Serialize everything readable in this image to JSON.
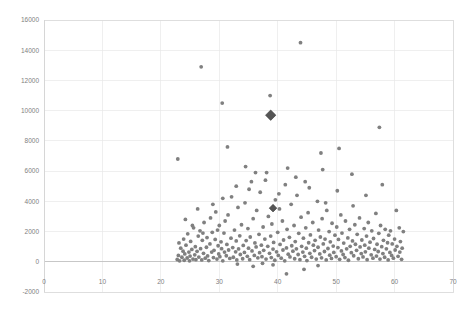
{
  "chart_data": {
    "type": "scatter",
    "title": "",
    "xlabel": "",
    "ylabel": "",
    "xlim": [
      0,
      70
    ],
    "ylim": [
      -2000,
      16000
    ],
    "grid": true,
    "legend": null,
    "xticks": [
      0,
      10,
      20,
      30,
      40,
      50,
      60,
      70
    ],
    "yticks": [
      -2000,
      0,
      2000,
      4000,
      6000,
      8000,
      10000,
      12000,
      14000,
      16000
    ],
    "xtick_labels": [
      "0",
      "10",
      "20",
      "30",
      "40",
      "50",
      "60",
      "70"
    ],
    "ytick_labels": [
      "-2000",
      "0",
      "2000",
      "4000",
      "6000",
      "8000",
      "10000",
      "12000",
      "14000",
      "16000"
    ],
    "marker_color": "#808080",
    "highlight_color": "#555555",
    "series": [
      {
        "name": "observations",
        "marker": "circle",
        "points": [
          [
            22.8,
            150
          ],
          [
            23.0,
            420
          ],
          [
            23.2,
            60
          ],
          [
            23.4,
            900
          ],
          [
            23.1,
            1250
          ],
          [
            23.6,
            300
          ],
          [
            23.8,
            700
          ],
          [
            23.9,
            1500
          ],
          [
            24.0,
            100
          ],
          [
            24.1,
            520
          ],
          [
            24.3,
            1100
          ],
          [
            24.5,
            250
          ],
          [
            24.6,
            1850
          ],
          [
            24.8,
            640
          ],
          [
            24.9,
            60
          ],
          [
            25.0,
            380
          ],
          [
            25.1,
            1350
          ],
          [
            25.3,
            820
          ],
          [
            25.5,
            180
          ],
          [
            25.6,
            2250
          ],
          [
            25.8,
            460
          ],
          [
            25.9,
            1000
          ],
          [
            26.0,
            140
          ],
          [
            26.2,
            690
          ],
          [
            26.4,
            1700
          ],
          [
            26.5,
            310
          ],
          [
            26.7,
            2050
          ],
          [
            26.8,
            870
          ],
          [
            27.0,
            120
          ],
          [
            27.1,
            1420
          ],
          [
            27.3,
            560
          ],
          [
            27.4,
            2600
          ],
          [
            27.6,
            240
          ],
          [
            27.8,
            960
          ],
          [
            27.9,
            1600
          ],
          [
            28.0,
            390
          ],
          [
            28.2,
            80
          ],
          [
            28.4,
            1180
          ],
          [
            28.5,
            2900
          ],
          [
            28.7,
            640
          ],
          [
            28.8,
            1950
          ],
          [
            29.0,
            280
          ],
          [
            29.1,
            760
          ],
          [
            29.3,
            1480
          ],
          [
            29.4,
            3300
          ],
          [
            29.6,
            180
          ],
          [
            29.8,
            1060
          ],
          [
            29.9,
            520
          ],
          [
            30.0,
            2400
          ],
          [
            30.1,
            340
          ],
          [
            30.3,
            1320
          ],
          [
            30.4,
            870
          ],
          [
            30.6,
            60
          ],
          [
            30.8,
            1900
          ],
          [
            30.9,
            640
          ],
          [
            31.0,
            2700
          ],
          [
            31.2,
            400
          ],
          [
            31.3,
            1150
          ],
          [
            31.5,
            3100
          ],
          [
            31.6,
            780
          ],
          [
            31.8,
            220
          ],
          [
            32.0,
            1560
          ],
          [
            32.1,
            4300
          ],
          [
            32.3,
            940
          ],
          [
            32.4,
            300
          ],
          [
            32.6,
            2100
          ],
          [
            32.8,
            660
          ],
          [
            32.9,
            1380
          ],
          [
            33.0,
            120
          ],
          [
            33.2,
            3600
          ],
          [
            33.3,
            850
          ],
          [
            33.5,
            1720
          ],
          [
            33.6,
            480
          ],
          [
            33.8,
            2450
          ],
          [
            34.0,
            200
          ],
          [
            34.1,
            1080
          ],
          [
            34.3,
            620
          ],
          [
            34.4,
            3900
          ],
          [
            34.6,
            1400
          ],
          [
            34.8,
            360
          ],
          [
            34.9,
            2200
          ],
          [
            35.0,
            900
          ],
          [
            35.2,
            140
          ],
          [
            35.3,
            1640
          ],
          [
            35.5,
            5300
          ],
          [
            35.6,
            720
          ],
          [
            35.8,
            2850
          ],
          [
            36.0,
            420
          ],
          [
            36.1,
            1250
          ],
          [
            36.3,
            980
          ],
          [
            36.4,
            3400
          ],
          [
            36.6,
            260
          ],
          [
            36.8,
            1820
          ],
          [
            36.9,
            600
          ],
          [
            37.0,
            4600
          ],
          [
            37.2,
            1100
          ],
          [
            37.3,
            340
          ],
          [
            37.5,
            2300
          ],
          [
            37.6,
            760
          ],
          [
            37.8,
            1500
          ],
          [
            38.0,
            180
          ],
          [
            38.1,
            5900
          ],
          [
            38.3,
            1020
          ],
          [
            38.4,
            3000
          ],
          [
            38.6,
            560
          ],
          [
            38.8,
            1700
          ],
          [
            38.9,
            280
          ],
          [
            39.0,
            2500
          ],
          [
            39.2,
            840
          ],
          [
            39.3,
            1280
          ],
          [
            39.5,
            100
          ],
          [
            39.6,
            4100
          ],
          [
            39.8,
            660
          ],
          [
            40.0,
            1950
          ],
          [
            40.1,
            420
          ],
          [
            40.3,
            3500
          ],
          [
            40.4,
            1150
          ],
          [
            40.6,
            240
          ],
          [
            40.8,
            2700
          ],
          [
            40.9,
            780
          ],
          [
            41.0,
            1440
          ],
          [
            41.2,
            60
          ],
          [
            41.3,
            5100
          ],
          [
            41.5,
            920
          ],
          [
            41.6,
            2150
          ],
          [
            41.8,
            500
          ],
          [
            42.0,
            1620
          ],
          [
            42.1,
            320
          ],
          [
            42.3,
            3800
          ],
          [
            42.4,
            1060
          ],
          [
            42.6,
            700
          ],
          [
            42.8,
            2400
          ],
          [
            42.9,
            200
          ],
          [
            43.0,
            1340
          ],
          [
            43.2,
            860
          ],
          [
            43.3,
            4400
          ],
          [
            43.5,
            480
          ],
          [
            43.6,
            1880
          ],
          [
            43.8,
            140
          ],
          [
            44.0,
            2950
          ],
          [
            44.1,
            1020
          ],
          [
            44.3,
            640
          ],
          [
            44.4,
            1560
          ],
          [
            44.6,
            360
          ],
          [
            44.8,
            2250
          ],
          [
            44.9,
            900
          ],
          [
            45.0,
            80
          ],
          [
            45.2,
            3250
          ],
          [
            45.3,
            1260
          ],
          [
            45.5,
            560
          ],
          [
            45.6,
            1780
          ],
          [
            45.8,
            300
          ],
          [
            46.0,
            2600
          ],
          [
            46.1,
            1100
          ],
          [
            46.3,
            740
          ],
          [
            46.4,
            1420
          ],
          [
            46.6,
            180
          ],
          [
            46.8,
            4000
          ],
          [
            46.9,
            960
          ],
          [
            47.0,
            2100
          ],
          [
            47.2,
            520
          ],
          [
            47.3,
            1640
          ],
          [
            47.5,
            260
          ],
          [
            47.6,
            2850
          ],
          [
            47.8,
            1180
          ],
          [
            48.0,
            680
          ],
          [
            48.1,
            1500
          ],
          [
            48.3,
            120
          ],
          [
            48.4,
            3400
          ],
          [
            48.6,
            880
          ],
          [
            48.8,
            2000
          ],
          [
            48.9,
            440
          ],
          [
            49.0,
            1320
          ],
          [
            49.2,
            220
          ],
          [
            49.3,
            2550
          ],
          [
            49.5,
            1040
          ],
          [
            49.6,
            620
          ],
          [
            49.8,
            1760
          ],
          [
            50.0,
            340
          ],
          [
            50.1,
            2300
          ],
          [
            50.3,
            940
          ],
          [
            50.4,
            1480
          ],
          [
            50.6,
            160
          ],
          [
            50.8,
            3100
          ],
          [
            50.9,
            720
          ],
          [
            51.0,
            1900
          ],
          [
            51.2,
            480
          ],
          [
            51.3,
            1240
          ],
          [
            51.5,
            280
          ],
          [
            51.6,
            2700
          ],
          [
            51.8,
            860
          ],
          [
            52.0,
            1580
          ],
          [
            52.1,
            100
          ],
          [
            52.3,
            2150
          ],
          [
            52.4,
            1020
          ],
          [
            52.6,
            600
          ],
          [
            52.8,
            1380
          ],
          [
            52.9,
            3700
          ],
          [
            53.0,
            400
          ],
          [
            53.2,
            2450
          ],
          [
            53.3,
            1160
          ],
          [
            53.5,
            760
          ],
          [
            53.6,
            1820
          ],
          [
            53.8,
            200
          ],
          [
            54.0,
            2900
          ],
          [
            54.1,
            980
          ],
          [
            54.3,
            540
          ],
          [
            54.4,
            1440
          ],
          [
            54.6,
            320
          ],
          [
            54.8,
            2200
          ],
          [
            54.9,
            1100
          ],
          [
            55.0,
            660
          ],
          [
            55.2,
            1700
          ],
          [
            55.3,
            140
          ],
          [
            55.5,
            2600
          ],
          [
            55.6,
            900
          ],
          [
            55.8,
            1300
          ],
          [
            56.0,
            460
          ],
          [
            56.1,
            2050
          ],
          [
            56.3,
            240
          ],
          [
            56.4,
            1540
          ],
          [
            56.6,
            820
          ],
          [
            56.8,
            3200
          ],
          [
            56.9,
            380
          ],
          [
            57.0,
            1160
          ],
          [
            57.2,
            680
          ],
          [
            57.3,
            1880
          ],
          [
            57.5,
            180
          ],
          [
            57.6,
            2400
          ],
          [
            57.8,
            1000
          ],
          [
            58.0,
            540
          ],
          [
            58.1,
            1420
          ],
          [
            58.3,
            300
          ],
          [
            58.4,
            2150
          ],
          [
            58.6,
            860
          ],
          [
            58.8,
            1260
          ],
          [
            58.9,
            120
          ],
          [
            59.0,
            1760
          ],
          [
            59.2,
            620
          ],
          [
            59.3,
            2050
          ],
          [
            59.5,
            420
          ],
          [
            59.6,
            1180
          ],
          [
            59.8,
            240
          ],
          [
            60.0,
            1500
          ],
          [
            60.1,
            780
          ],
          [
            60.3,
            3400
          ],
          [
            60.4,
            1020
          ],
          [
            60.6,
            360
          ],
          [
            60.8,
            2250
          ],
          [
            60.9,
            640
          ],
          [
            61.0,
            1340
          ],
          [
            61.2,
            160
          ],
          [
            61.3,
            900
          ],
          [
            61.5,
            2000
          ],
          [
            30.6,
            4200
          ],
          [
            32.9,
            5000
          ],
          [
            35.1,
            4800
          ],
          [
            37.9,
            5400
          ],
          [
            40.2,
            4500
          ],
          [
            43.1,
            5600
          ],
          [
            45.4,
            4900
          ],
          [
            47.7,
            6100
          ],
          [
            50.2,
            4700
          ],
          [
            52.7,
            5800
          ],
          [
            55.1,
            4400
          ],
          [
            57.9,
            5100
          ],
          [
            26.3,
            3500
          ],
          [
            28.9,
            3800
          ],
          [
            24.2,
            2800
          ],
          [
            34.5,
            6300
          ],
          [
            36.2,
            5900
          ],
          [
            41.7,
            6200
          ],
          [
            44.7,
            5300
          ],
          [
            48.2,
            3900
          ],
          [
            31.4,
            7600
          ],
          [
            29.7,
            2100
          ],
          [
            27.2,
            1900
          ],
          [
            25.4,
            2400
          ],
          [
            22.9,
            6800
          ],
          [
            26.9,
            12900
          ],
          [
            30.5,
            10500
          ],
          [
            38.7,
            11000
          ],
          [
            43.9,
            14500
          ],
          [
            47.4,
            7200
          ],
          [
            50.5,
            7500
          ],
          [
            57.4,
            8900
          ],
          [
            41.5,
            -800
          ],
          [
            39.2,
            -200
          ],
          [
            37.4,
            -100
          ],
          [
            35.8,
            -300
          ],
          [
            44.5,
            -500
          ],
          [
            33.1,
            -150
          ],
          [
            46.9,
            -250
          ]
        ]
      }
    ],
    "highlight_points": [
      {
        "x": 38.8,
        "y": 9700,
        "marker": "diamond",
        "size": "large"
      },
      {
        "x": 39.2,
        "y": 3550,
        "marker": "diamond",
        "size": "medium"
      }
    ]
  }
}
